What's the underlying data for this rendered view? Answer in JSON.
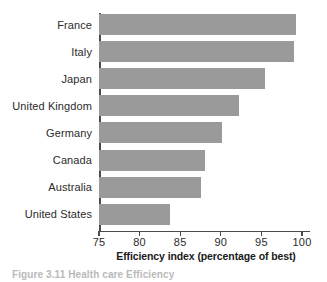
{
  "chart_data": {
    "type": "bar",
    "orientation": "horizontal",
    "title": "",
    "xlabel": "Efficiency index (percentage of best)",
    "ylabel": "",
    "xlim": [
      75,
      100
    ],
    "xticks": [
      75,
      80,
      85,
      90,
      95,
      100
    ],
    "xtick_labels": [
      "75",
      "80",
      "85",
      "90",
      "95",
      "100"
    ],
    "grid": false,
    "legend": null,
    "bar_color": "#9a9a9a",
    "axis_color": "#4a4a4a",
    "categories": [
      "France",
      "Italy",
      "Japan",
      "United Kingdom",
      "Germany",
      "Canada",
      "Australia",
      "United States"
    ],
    "values": [
      99.3,
      99.0,
      95.5,
      92.3,
      90.1,
      88.0,
      87.5,
      83.8
    ]
  },
  "caption": {
    "text": "Figure 3.11 Health care Efficiency"
  }
}
